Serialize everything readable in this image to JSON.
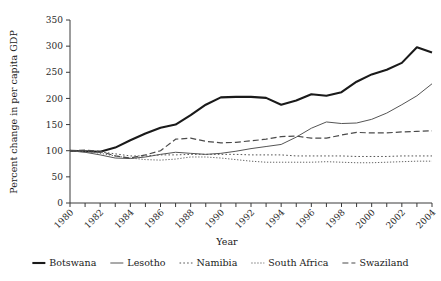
{
  "chart_data": {
    "type": "line",
    "title": "",
    "xlabel": "Year",
    "ylabel": "Percent change in per capita GDP",
    "xlim": [
      1980,
      2004
    ],
    "ylim": [
      0,
      350
    ],
    "ytick_step": 50,
    "xtick_step": 1,
    "xtick_label_step": 2,
    "grid": false,
    "legend_position": "bottom",
    "x": [
      1980,
      1981,
      1982,
      1983,
      1984,
      1985,
      1986,
      1987,
      1988,
      1989,
      1990,
      1991,
      1992,
      1993,
      1994,
      1995,
      1996,
      1997,
      1998,
      1999,
      2000,
      2001,
      2002,
      2003,
      2004
    ],
    "ytick_labels": [
      "0",
      "50",
      "100",
      "150",
      "200",
      "250",
      "300",
      "350"
    ],
    "xtick_labels": [
      "1980",
      "1982",
      "1984",
      "1986",
      "1988",
      "1990",
      "1992",
      "1994",
      "1996",
      "1998",
      "2000",
      "2002",
      "2004"
    ],
    "series": [
      {
        "name": "Botswana",
        "style": "solid",
        "width": 2.1,
        "color": "#1a1a1a",
        "values": [
          100,
          99,
          98,
          106,
          120,
          133,
          144,
          150,
          168,
          188,
          202,
          203,
          203,
          201,
          188,
          196,
          208,
          205,
          212,
          232,
          246,
          255,
          268,
          298,
          288
        ]
      },
      {
        "name": "Lesotho",
        "style": "solid",
        "width": 1.0,
        "color": "#555555",
        "values": [
          100,
          97,
          92,
          86,
          85,
          88,
          93,
          97,
          95,
          93,
          95,
          99,
          104,
          108,
          112,
          126,
          143,
          155,
          152,
          153,
          160,
          172,
          188,
          205,
          228
        ]
      },
      {
        "name": "Namibia",
        "style": "dotted",
        "width": 1.0,
        "color": "#555555",
        "values": [
          100,
          100,
          98,
          94,
          90,
          90,
          92,
          92,
          93,
          93,
          93,
          93,
          92,
          92,
          92,
          90,
          90,
          90,
          90,
          89,
          89,
          89,
          90,
          90,
          90
        ]
      },
      {
        "name": "South Africa",
        "style": "densely-dotted",
        "width": 1.0,
        "color": "#666666",
        "values": [
          100,
          99,
          95,
          90,
          86,
          83,
          82,
          84,
          88,
          88,
          86,
          83,
          80,
          78,
          78,
          78,
          78,
          79,
          78,
          77,
          77,
          78,
          79,
          80,
          80
        ]
      },
      {
        "name": "Swaziland",
        "style": "dashed",
        "width": 1.2,
        "color": "#4a4a4a",
        "values": [
          100,
          101,
          99,
          90,
          86,
          92,
          100,
          122,
          124,
          118,
          115,
          116,
          119,
          122,
          127,
          128,
          124,
          124,
          130,
          135,
          134,
          134,
          136,
          137,
          138
        ]
      }
    ]
  },
  "legend": {
    "items": [
      {
        "label": "Botswana"
      },
      {
        "label": "Lesotho"
      },
      {
        "label": "Namibia"
      },
      {
        "label": "South Africa"
      },
      {
        "label": "Swaziland"
      }
    ]
  }
}
